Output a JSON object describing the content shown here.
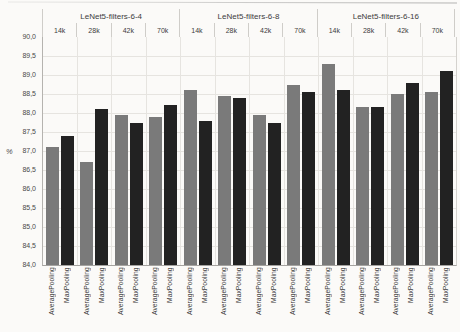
{
  "chart_data": {
    "type": "bar",
    "title": "",
    "ylabel": "%",
    "xlabel": "",
    "ylim": [
      84.0,
      90.0
    ],
    "ytick_step": 0.5,
    "decimal_separator": ",",
    "ytick_labels_top_to_bottom": [
      "90,0",
      "89,5",
      "89,0",
      "88,5",
      "88,0",
      "87,5",
      "87,0",
      "86,5",
      "86,0",
      "85,5",
      "85,0",
      "84,5",
      "84,0"
    ],
    "grid": true,
    "legend_position": "none",
    "series_names": [
      "AveragePooling",
      "MaxPooling"
    ],
    "series_colors": [
      "#7a7a7a",
      "#222222"
    ],
    "groups": [
      {
        "label": "LeNet5-filters-6-4",
        "categories": [
          "14k",
          "28k",
          "42k",
          "70k"
        ],
        "series": [
          {
            "name": "AveragePooling",
            "values": [
              87.1,
              86.7,
              87.95,
              87.9
            ]
          },
          {
            "name": "MaxPooling",
            "values": [
              87.4,
              88.1,
              87.75,
              88.2
            ]
          }
        ]
      },
      {
        "label": "LeNet5-filters-6-8",
        "categories": [
          "14k",
          "28k",
          "42k",
          "70k"
        ],
        "series": [
          {
            "name": "AveragePooling",
            "values": [
              88.6,
              88.45,
              87.95,
              88.75
            ]
          },
          {
            "name": "MaxPooling",
            "values": [
              87.8,
              88.4,
              87.75,
              88.55
            ]
          }
        ]
      },
      {
        "label": "LeNet5-filters-6-16",
        "categories": [
          "14k",
          "28k",
          "42k",
          "70k"
        ],
        "series": [
          {
            "name": "AveragePooling",
            "values": [
              89.3,
              88.15,
              88.5,
              88.55
            ]
          },
          {
            "name": "MaxPooling",
            "values": [
              88.6,
              88.15,
              88.8,
              89.1
            ]
          }
        ]
      }
    ]
  }
}
